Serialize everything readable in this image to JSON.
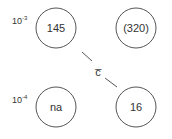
{
  "row_labels": [
    {
      "base": "10",
      "exp": "-3"
    },
    {
      "base": "10",
      "exp": "-4"
    }
  ],
  "nodes": [
    {
      "label": "145"
    },
    {
      "label": "(320)"
    },
    {
      "label": "na"
    },
    {
      "label": "16"
    }
  ],
  "connector": {
    "label": "c̅"
  },
  "colors": {
    "stroke": "#555555",
    "text": "#333333"
  }
}
